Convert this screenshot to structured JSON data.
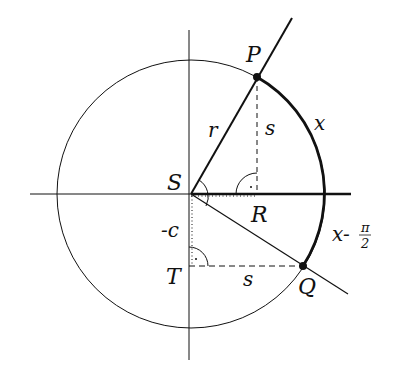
{
  "diagram": {
    "type": "unit-circle-geometry",
    "colors": {
      "ink": "#111111",
      "background": "#ffffff"
    },
    "labels": {
      "P": "P",
      "Q": "Q",
      "S": "S",
      "R": "R",
      "T": "T",
      "r": "r",
      "s_vertical": "s",
      "s_horizontal": "s",
      "x": "x",
      "neg_c": "-c",
      "x_minus": "x-",
      "pi": "π",
      "two": "2"
    },
    "points": {
      "S": [
        191,
        194
      ],
      "P": [
        257,
        77
      ],
      "Q": [
        303,
        266
      ],
      "R": [
        257,
        194
      ],
      "T": [
        189,
        266
      ]
    },
    "circle": {
      "cx": 191,
      "cy": 194,
      "r": 134
    }
  }
}
